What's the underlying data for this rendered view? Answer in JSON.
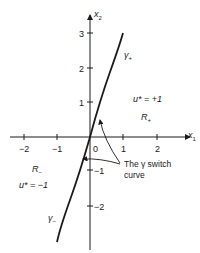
{
  "diagram": {
    "axes": {
      "x_label": "x",
      "x_sub": "1",
      "y_label": "x",
      "y_sub": "2",
      "x_ticks": [
        {
          "label": "−2",
          "x": 24
        },
        {
          "label": "−1",
          "x": 57
        },
        {
          "label": "1",
          "x": 123
        },
        {
          "label": "2",
          "x": 157
        }
      ],
      "y_ticks": [
        {
          "label": "3",
          "y": 33
        },
        {
          "label": "2",
          "y": 68
        },
        {
          "label": "1",
          "y": 102
        },
        {
          "label": "−1",
          "y": 170
        },
        {
          "label": "−2",
          "y": 206
        }
      ],
      "origin_label": "0"
    },
    "curves": {
      "gamma_plus": {
        "label": "γ",
        "sub": "+"
      },
      "gamma_minus": {
        "label": "γ",
        "sub": "−"
      }
    },
    "regions": {
      "r_plus": {
        "label": "R",
        "sub": "+",
        "control": "u* = +1"
      },
      "r_minus": {
        "label": "R",
        "sub": "−",
        "control": "u* = −1"
      }
    },
    "annotation": {
      "line1": "The γ switch",
      "line2": "curve"
    }
  }
}
